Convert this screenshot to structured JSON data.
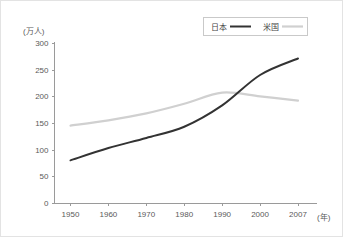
{
  "chart_data": {
    "type": "line",
    "title": "",
    "xlabel": "(年)",
    "ylabel": "(万人)",
    "x": [
      "1950",
      "1960",
      "1970",
      "1980",
      "1990",
      "2000",
      "2007"
    ],
    "categories": [
      "1950",
      "1960",
      "1970",
      "1980",
      "1990",
      "2000",
      "2007"
    ],
    "series": [
      {
        "name": "日本",
        "color": "#333333",
        "values": [
          80,
          103,
          122,
          143,
          183,
          240,
          271
        ]
      },
      {
        "name": "米国",
        "color": "#d0d0d0",
        "values": [
          145,
          155,
          168,
          186,
          207,
          200,
          192
        ]
      }
    ],
    "ylim": [
      0,
      300
    ],
    "yticks": [
      0,
      50,
      100,
      150,
      200,
      250,
      300
    ],
    "ytick_labels": [
      "0",
      "50",
      "100",
      "150",
      "200",
      "250",
      "300"
    ],
    "xtick_labels": [
      "1950",
      "1960",
      "1970",
      "1980",
      "1990",
      "2000",
      "2007"
    ],
    "grid": false,
    "legend_position": "top-right"
  },
  "axes": {
    "y_unit": "(万人)",
    "x_unit": "(年)",
    "y_ticks": [
      "300",
      "250",
      "200",
      "150",
      "100",
      "50",
      "0"
    ],
    "x_ticks": [
      "1950",
      "1960",
      "1970",
      "1980",
      "1990",
      "2000",
      "2007"
    ]
  },
  "legend": {
    "items": [
      {
        "label": "日本",
        "color": "#333333"
      },
      {
        "label": "米国",
        "color": "#d0d0d0"
      }
    ]
  }
}
